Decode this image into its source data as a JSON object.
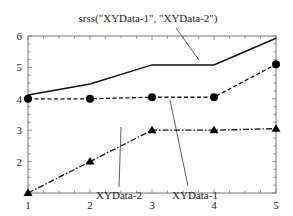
{
  "chart_data": {
    "type": "line",
    "title": "",
    "xlabel": "",
    "ylabel": "",
    "xlim": [
      1,
      5
    ],
    "ylim": [
      1,
      6
    ],
    "x_ticks": [
      "1",
      "2",
      "3",
      "4",
      "5"
    ],
    "y_ticks": [
      "2",
      "3",
      "4",
      "5",
      "6"
    ],
    "grid": false,
    "legend": "none (callout annotations)",
    "x": [
      1,
      2,
      3,
      4,
      5
    ],
    "series": [
      {
        "name": "srss(\"XYData-1\", \"XYData-2\")",
        "style": "solid",
        "marker": "none",
        "values": [
          4.12,
          4.47,
          5.08,
          5.08,
          5.93
        ]
      },
      {
        "name": "XYData-1",
        "style": "dashed",
        "marker": "circle",
        "values": [
          4.0,
          4.0,
          4.05,
          4.05,
          5.1
        ]
      },
      {
        "name": "XYData-2",
        "style": "dash-dot",
        "marker": "triangle",
        "values": [
          1.0,
          2.0,
          3.0,
          3.0,
          3.05
        ]
      }
    ],
    "annotations": [
      {
        "text": "srss(\"XYData-1\", \"XYData-2\")",
        "points_to": "srss"
      },
      {
        "text": "XYData-2",
        "points_to": "XYData-2"
      },
      {
        "text": "XYData-1",
        "points_to": "XYData-1"
      }
    ]
  }
}
